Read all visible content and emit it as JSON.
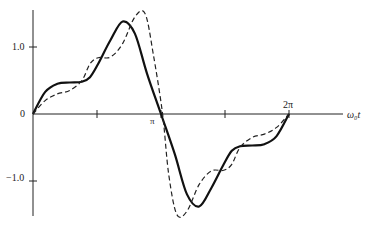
{
  "chart_data": {
    "type": "line",
    "title": "",
    "xlabel": "ω₀t",
    "ylabel": "",
    "x_ticks": [
      {
        "value": 0,
        "label": "0"
      },
      {
        "value": 1.5708,
        "label": ""
      },
      {
        "value": 3.1416,
        "label": "π"
      },
      {
        "value": 4.7124,
        "label": ""
      },
      {
        "value": 6.2832,
        "label": "2π"
      }
    ],
    "y_ticks": [
      {
        "value": 1.0,
        "label": "1.0"
      },
      {
        "value": 0,
        "label": "0"
      },
      {
        "value": -1.0,
        "label": "−1.0"
      }
    ],
    "xlim": [
      0,
      6.2832
    ],
    "ylim": [
      -1.6,
      1.55
    ],
    "grid": false,
    "legend": "none",
    "series": [
      {
        "name": "solid",
        "style": "solid",
        "x": [
          0,
          0.3,
          0.6,
          0.9,
          1.2,
          1.4,
          1.6,
          1.9,
          2.2,
          2.5,
          2.8,
          3.1416,
          3.48,
          3.78,
          4.08,
          4.38,
          4.68,
          4.88,
          5.08,
          5.38,
          5.68,
          5.98,
          6.2832
        ],
        "y": [
          0,
          0.33,
          0.45,
          0.47,
          0.48,
          0.55,
          0.75,
          1.1,
          1.38,
          1.2,
          0.6,
          0,
          -0.6,
          -1.2,
          -1.38,
          -1.1,
          -0.75,
          -0.55,
          -0.48,
          -0.47,
          -0.45,
          -0.33,
          0
        ]
      },
      {
        "name": "dashed",
        "style": "dashed",
        "x": [
          0,
          0.3,
          0.6,
          0.9,
          1.2,
          1.4,
          1.6,
          1.9,
          2.2,
          2.5,
          2.75,
          2.95,
          3.18,
          3.33,
          3.53,
          3.78,
          4.08,
          4.38,
          4.68,
          4.88,
          5.08,
          5.38,
          5.68,
          5.98,
          6.2832
        ],
        "y": [
          0,
          0.2,
          0.3,
          0.35,
          0.5,
          0.75,
          0.84,
          0.85,
          1.05,
          1.45,
          1.5,
          0.9,
          0,
          -0.9,
          -1.5,
          -1.45,
          -1.05,
          -0.85,
          -0.84,
          -0.75,
          -0.5,
          -0.35,
          -0.3,
          -0.2,
          0
        ]
      }
    ]
  }
}
